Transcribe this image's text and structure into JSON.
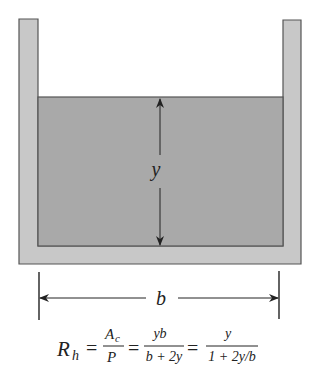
{
  "diagram": {
    "colors": {
      "wall_fill": "#c8c8c8",
      "water_fill": "#a9a9a9",
      "outline": "#555555",
      "ink": "#222222"
    },
    "labels": {
      "depth": "y",
      "width": "b"
    },
    "equation": {
      "lhs_main": "R",
      "lhs_sub": "h",
      "eq1": "=",
      "frac1_num_main": "A",
      "frac1_num_sub": "c",
      "frac1_den": "P",
      "eq2": "=",
      "frac2_num": "yb",
      "frac2_den": "b + 2y",
      "eq3": "=",
      "frac3_num": "y",
      "frac3_den": "1 + 2y/b"
    }
  }
}
